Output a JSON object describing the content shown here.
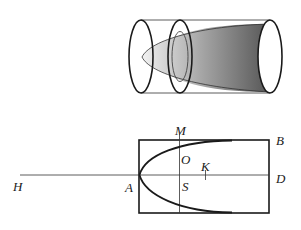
{
  "figure": {
    "top": {
      "description": "paraboloid inside cylinder",
      "colors": {
        "stroke": "#1a1a1a",
        "shade_dark": "#555555",
        "shade_light": "#f0f0f0"
      }
    },
    "bottom": {
      "labels": {
        "M": "M",
        "B": "B",
        "O": "O",
        "K": "K",
        "H": "H",
        "A": "A",
        "S": "S",
        "D": "D"
      }
    }
  }
}
